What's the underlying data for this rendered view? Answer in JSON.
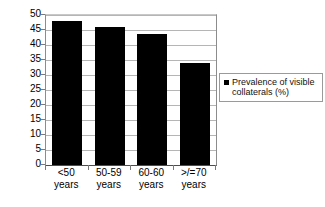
{
  "chart_data": {
    "type": "bar",
    "title": "",
    "subtitle": "",
    "xlabel": "",
    "ylabel": "",
    "categories": [
      "<50 years",
      "50-59 years",
      "60-60 years",
      ">/=70 years"
    ],
    "category_lines": [
      [
        "<50",
        "years"
      ],
      [
        "50-59",
        "years"
      ],
      [
        "60-60",
        "years"
      ],
      [
        ">/=70",
        "years"
      ]
    ],
    "series": [
      {
        "name": "Prevalence of visible collaterals (%)",
        "color": "#000000",
        "values": [
          48,
          46,
          43.5,
          34
        ]
      }
    ],
    "ylim": [
      0,
      50
    ],
    "ytick_step": 5,
    "yticks": [
      "50",
      "45",
      "40",
      "35",
      "30",
      "25",
      "20",
      "15",
      "10",
      "5",
      "0"
    ],
    "grid": true,
    "grid_color": "#b5b5b5",
    "legend_position": "right",
    "legend_entries": [
      {
        "label_line1": "Prevalence of visible",
        "label_line2": "collaterals (%)",
        "marker": "square",
        "color": "#000000"
      }
    ]
  },
  "legend": {
    "text": "Prevalence of visible collaterals (%)"
  }
}
